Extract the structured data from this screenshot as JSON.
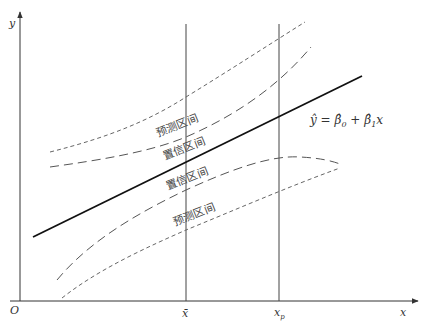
{
  "diagram": {
    "title": "",
    "axes": {
      "origin_label": "O",
      "x_label": "x",
      "y_label": "y"
    },
    "vertical_markers": [
      {
        "id": "xbar",
        "label": "x̄",
        "x": 186
      },
      {
        "id": "xp",
        "label_main": "x",
        "label_sub": "p",
        "x": 279
      }
    ],
    "regression_equation": {
      "lhs": "ŷ",
      "eq": " = ",
      "b0": "β̂",
      "b0_sub": "0",
      "plus": " + ",
      "b1": "β̂",
      "b1_sub": "1",
      "var": "x"
    },
    "band_labels": {
      "upper_prediction": "预测区间",
      "upper_confidence": "置信区间",
      "lower_confidence": "置信区间",
      "lower_prediction": "预测区间"
    },
    "colors": {
      "axis": "#333333",
      "regression_line": "#111111",
      "confidence_band": "#555555",
      "prediction_band": "#666666",
      "background": "#ffffff"
    }
  }
}
